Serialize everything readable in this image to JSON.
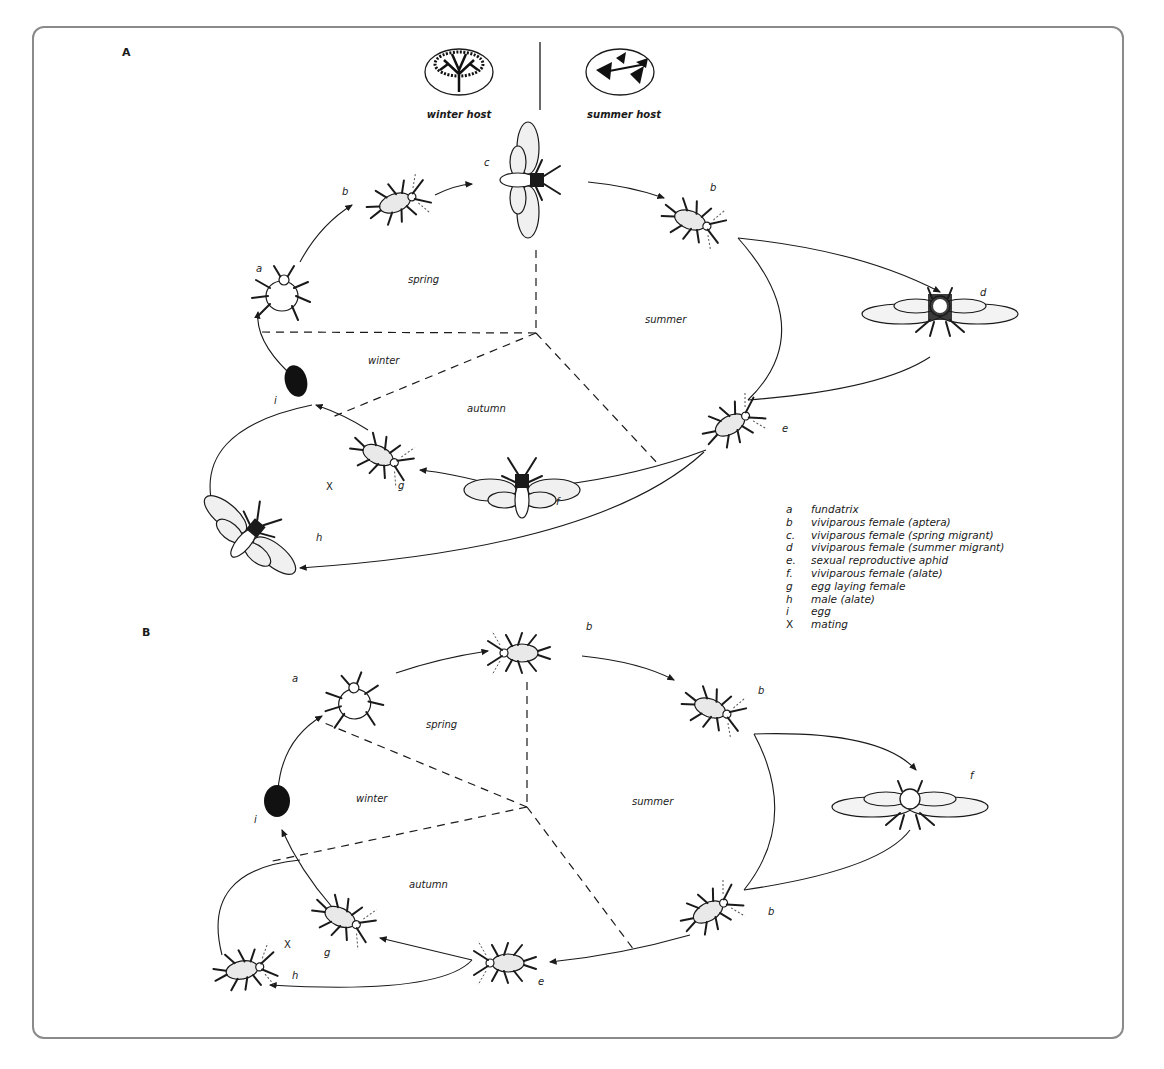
{
  "diagram": {
    "panels": [
      {
        "id": "A",
        "label": "A",
        "hosts": {
          "winter": "winter host",
          "summer": "summer host"
        },
        "seasons": {
          "spring": "spring",
          "summer": "summer",
          "autumn": "autumn",
          "winter": "winter"
        },
        "stage_labels": {
          "a": "a",
          "b1": "b",
          "c": "c",
          "b2": "b",
          "d": "d",
          "e": "e",
          "f": "f",
          "g": "g",
          "h": "h",
          "i": "i",
          "x": "X"
        }
      },
      {
        "id": "B",
        "label": "B",
        "seasons": {
          "spring": "spring",
          "summer": "summer",
          "autumn": "autumn",
          "winter": "winter"
        },
        "stage_labels": {
          "a": "a",
          "b1": "b",
          "b2": "b",
          "b3": "b",
          "f": "f",
          "e": "e",
          "g": "g",
          "h": "h",
          "i": "i",
          "x": "X"
        }
      }
    ],
    "legend": [
      {
        "key": "a",
        "text": "fundatrix"
      },
      {
        "key": "b",
        "text": "viviparous female (aptera)"
      },
      {
        "key": "c.",
        "text": "viviparous female (spring migrant)"
      },
      {
        "key": "d",
        "text": "viviparous female (summer migrant)"
      },
      {
        "key": "e.",
        "text": "sexual reproductive aphid"
      },
      {
        "key": "f.",
        "text": "viviparous female (alate)"
      },
      {
        "key": "g",
        "text": "egg laying female"
      },
      {
        "key": "h",
        "text": "male (alate)"
      },
      {
        "key": "i",
        "text": "egg"
      },
      {
        "key": "X",
        "text": "mating"
      }
    ]
  }
}
